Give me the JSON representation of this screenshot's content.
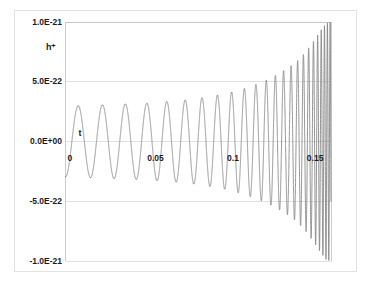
{
  "chart_data": {
    "type": "line",
    "title": "",
    "subtitle": "",
    "xlabel": "t",
    "ylabel": "h⁺",
    "xlim": [
      0,
      0.1664
    ],
    "ylim": [
      -1e-21,
      1e-21
    ],
    "grid": true,
    "legend": null,
    "legend_position": "none",
    "series_color": "#808080",
    "gridline_color": "#d9d9d9",
    "axis_color": "#bfbfbf",
    "background_color": "#ffffff",
    "x_ticks": [
      {
        "value": 0,
        "label": "0"
      },
      {
        "value": 0.05,
        "label": "0.05"
      },
      {
        "value": 0.1,
        "label": "0.1"
      },
      {
        "value": 0.15,
        "label": "0.15"
      }
    ],
    "y_ticks": [
      {
        "value": 1e-21,
        "label": "1.0E-21"
      },
      {
        "value": 5e-22,
        "label": "5.0E-22"
      },
      {
        "value": 0.0,
        "label": "0.0E+00"
      },
      {
        "value": -5e-22,
        "label": "-5.0E-22"
      },
      {
        "value": -1e-21,
        "label": "-1.0E-21"
      }
    ],
    "envelope": [
      {
        "t": 0.0,
        "amplitude": 2.95e-22
      },
      {
        "t": 0.01,
        "amplitude": 3e-22
      },
      {
        "t": 0.02,
        "amplitude": 3.05e-22
      },
      {
        "t": 0.03,
        "amplitude": 3.1e-22
      },
      {
        "t": 0.04,
        "amplitude": 3.15e-22
      },
      {
        "t": 0.05,
        "amplitude": 3.2e-22
      },
      {
        "t": 0.06,
        "amplitude": 3.3e-22
      },
      {
        "t": 0.07,
        "amplitude": 3.4e-22
      },
      {
        "t": 0.08,
        "amplitude": 3.55e-22
      },
      {
        "t": 0.09,
        "amplitude": 3.75e-22
      },
      {
        "t": 0.1,
        "amplitude": 4e-22
      },
      {
        "t": 0.11,
        "amplitude": 4.35e-22
      },
      {
        "t": 0.12,
        "amplitude": 4.8e-22
      },
      {
        "t": 0.13,
        "amplitude": 5.4e-22
      },
      {
        "t": 0.14,
        "amplitude": 6.2e-22
      },
      {
        "t": 0.145,
        "amplitude": 6.7e-22
      },
      {
        "t": 0.15,
        "amplitude": 7.4e-22
      },
      {
        "t": 0.155,
        "amplitude": 8.3e-22
      },
      {
        "t": 0.16,
        "amplitude": 9.3e-22
      },
      {
        "t": 0.1635,
        "amplitude": 9.9e-22
      },
      {
        "t": 0.1664,
        "amplitude": 1e-21
      }
    ],
    "frequency_hz": [
      {
        "t": 0.0,
        "f": 62
      },
      {
        "t": 0.025,
        "f": 68
      },
      {
        "t": 0.05,
        "f": 76
      },
      {
        "t": 0.075,
        "f": 90
      },
      {
        "t": 0.1,
        "f": 112
      },
      {
        "t": 0.12,
        "f": 145
      },
      {
        "t": 0.14,
        "f": 215
      },
      {
        "t": 0.155,
        "f": 340
      },
      {
        "t": 0.1664,
        "f": 620
      }
    ]
  }
}
